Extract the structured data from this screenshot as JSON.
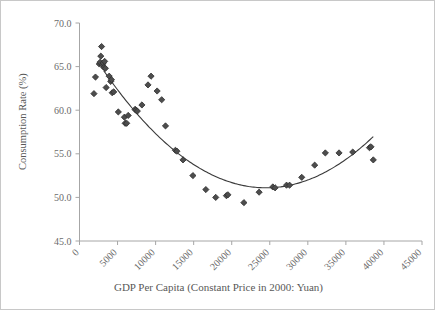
{
  "chart_data": {
    "type": "scatter",
    "title": "",
    "xlabel": "GDP Per Capita (Constant Price in 2000: Yuan)",
    "ylabel": "Consumption Rate (%)",
    "xlim": [
      0,
      45000
    ],
    "ylim": [
      45.0,
      70.0
    ],
    "xticks": [
      0,
      5000,
      10000,
      15000,
      20000,
      25000,
      30000,
      35000,
      40000,
      45000
    ],
    "xtick_labels": [
      "0",
      "5000",
      "10000",
      "15000",
      "20000",
      "25000",
      "30000",
      "35000",
      "40000",
      "45000"
    ],
    "yticks": [
      45.0,
      50.0,
      55.0,
      60.0,
      65.0,
      70.0
    ],
    "ytick_labels": [
      "45.0",
      "50.0",
      "55.0",
      "60.0",
      "65.0",
      "70.0"
    ],
    "grid": false,
    "legend": false,
    "xtick_label_rotation_deg": -45,
    "marker": "diamond",
    "marker_color": "#4d4d4d",
    "marker_size": 5,
    "curve_color": "#3a3a3a",
    "curve_label": "quadratic trend line",
    "axis_color": "#a6a6a6",
    "background_color": "#ffffff",
    "points": [
      {
        "x": 1900,
        "y": 61.9
      },
      {
        "x": 2100,
        "y": 63.8
      },
      {
        "x": 2600,
        "y": 65.3
      },
      {
        "x": 2700,
        "y": 65.5
      },
      {
        "x": 2800,
        "y": 66.2
      },
      {
        "x": 2900,
        "y": 67.3
      },
      {
        "x": 3000,
        "y": 65.2
      },
      {
        "x": 3100,
        "y": 65.4
      },
      {
        "x": 3200,
        "y": 64.9
      },
      {
        "x": 3300,
        "y": 65.6
      },
      {
        "x": 3400,
        "y": 64.8
      },
      {
        "x": 3500,
        "y": 62.6
      },
      {
        "x": 3900,
        "y": 63.9
      },
      {
        "x": 4100,
        "y": 63.3
      },
      {
        "x": 4200,
        "y": 63.5
      },
      {
        "x": 4300,
        "y": 62.0
      },
      {
        "x": 4500,
        "y": 62.1
      },
      {
        "x": 5100,
        "y": 59.8
      },
      {
        "x": 5900,
        "y": 59.2
      },
      {
        "x": 6000,
        "y": 58.5
      },
      {
        "x": 6200,
        "y": 58.5
      },
      {
        "x": 6400,
        "y": 59.4
      },
      {
        "x": 7300,
        "y": 60.1
      },
      {
        "x": 7400,
        "y": 60.0
      },
      {
        "x": 7600,
        "y": 59.9
      },
      {
        "x": 8200,
        "y": 60.6
      },
      {
        "x": 9000,
        "y": 62.9
      },
      {
        "x": 9400,
        "y": 63.9
      },
      {
        "x": 10200,
        "y": 62.2
      },
      {
        "x": 10800,
        "y": 61.2
      },
      {
        "x": 11300,
        "y": 58.2
      },
      {
        "x": 12600,
        "y": 55.4
      },
      {
        "x": 12800,
        "y": 55.3
      },
      {
        "x": 13600,
        "y": 54.3
      },
      {
        "x": 14900,
        "y": 52.5
      },
      {
        "x": 16600,
        "y": 50.9
      },
      {
        "x": 17900,
        "y": 50.0
      },
      {
        "x": 19300,
        "y": 50.2
      },
      {
        "x": 19500,
        "y": 50.3
      },
      {
        "x": 21600,
        "y": 49.4
      },
      {
        "x": 23600,
        "y": 50.6
      },
      {
        "x": 25400,
        "y": 51.2
      },
      {
        "x": 25700,
        "y": 51.1
      },
      {
        "x": 27200,
        "y": 51.4
      },
      {
        "x": 27600,
        "y": 51.4
      },
      {
        "x": 29200,
        "y": 52.3
      },
      {
        "x": 30900,
        "y": 53.7
      },
      {
        "x": 32300,
        "y": 55.1
      },
      {
        "x": 34100,
        "y": 55.1
      },
      {
        "x": 35900,
        "y": 55.2
      },
      {
        "x": 38100,
        "y": 55.7
      },
      {
        "x": 38300,
        "y": 55.8
      },
      {
        "x": 38600,
        "y": 54.3
      }
    ],
    "curve": {
      "type": "quadratic-fit",
      "x_start": 3200,
      "x_end": 38600,
      "vertex_x": 24500,
      "vertex_y": 51.1,
      "y_at_start": 65.6,
      "y_at_end": 56.5
    }
  }
}
